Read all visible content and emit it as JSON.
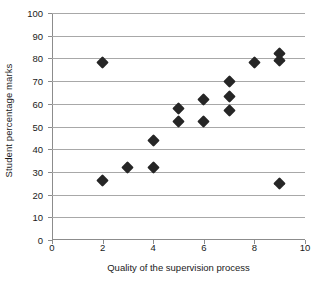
{
  "chart_data": {
    "type": "scatter",
    "title": "",
    "xlabel": "Quality of the supervision process",
    "ylabel": "Student percentage marks",
    "xlim": [
      0,
      10
    ],
    "ylim": [
      0,
      100
    ],
    "xticks": [
      0,
      2,
      4,
      6,
      8,
      10
    ],
    "yticks": [
      0,
      10,
      20,
      30,
      40,
      50,
      60,
      70,
      80,
      90,
      100
    ],
    "xtick_labels": [
      "0",
      "2",
      "4",
      "6",
      "8",
      "10"
    ],
    "ytick_labels": [
      "0",
      "10",
      "20",
      "30",
      "40",
      "50",
      "60",
      "70",
      "80",
      "90",
      "100"
    ],
    "grid": "horizontal",
    "legend": null,
    "marker": "diamond",
    "marker_color": "#262626",
    "grid_color": "#a8a8a8",
    "axis_color": "#8c8c8c",
    "points": [
      {
        "x": 2,
        "y": 78
      },
      {
        "x": 2,
        "y": 26
      },
      {
        "x": 3,
        "y": 32
      },
      {
        "x": 4,
        "y": 44
      },
      {
        "x": 4,
        "y": 32
      },
      {
        "x": 5,
        "y": 58
      },
      {
        "x": 5,
        "y": 52
      },
      {
        "x": 6,
        "y": 62
      },
      {
        "x": 6,
        "y": 52
      },
      {
        "x": 7,
        "y": 70
      },
      {
        "x": 7,
        "y": 63
      },
      {
        "x": 7,
        "y": 57
      },
      {
        "x": 8,
        "y": 78
      },
      {
        "x": 9,
        "y": 82
      },
      {
        "x": 9,
        "y": 79
      },
      {
        "x": 9,
        "y": 25
      }
    ]
  }
}
